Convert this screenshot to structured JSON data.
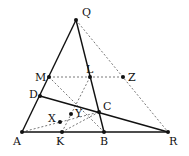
{
  "diagram": {
    "points": [
      {
        "name": "Q",
        "x": 76,
        "y": 20,
        "lx": 82,
        "ly": 16
      },
      {
        "name": "M",
        "x": 49,
        "y": 77,
        "lx": 35,
        "ly": 81
      },
      {
        "name": "L",
        "x": 90,
        "y": 77,
        "lx": 86,
        "ly": 73
      },
      {
        "name": "Z",
        "x": 123,
        "y": 77,
        "lx": 128,
        "ly": 81
      },
      {
        "name": "D",
        "x": 40,
        "y": 96,
        "lx": 29,
        "ly": 98
      },
      {
        "name": "C",
        "x": 99,
        "y": 112,
        "lx": 103,
        "ly": 110
      },
      {
        "name": "Y",
        "x": 71,
        "y": 114,
        "lx": 75,
        "ly": 117
      },
      {
        "name": "X",
        "x": 60,
        "y": 122,
        "lx": 48,
        "ly": 122
      },
      {
        "name": "A",
        "x": 22,
        "y": 132,
        "lx": 13,
        "ly": 145
      },
      {
        "name": "K",
        "x": 62,
        "y": 132,
        "lx": 56,
        "ly": 145
      },
      {
        "name": "B",
        "x": 104,
        "y": 132,
        "lx": 100,
        "ly": 145
      },
      {
        "name": "R",
        "x": 168,
        "y": 132,
        "lx": 169,
        "ly": 145
      }
    ],
    "solid_segments": [
      [
        "A",
        "Q"
      ],
      [
        "Q",
        "B"
      ],
      [
        "A",
        "R"
      ],
      [
        "D",
        "R"
      ]
    ],
    "dashed_segments": [
      [
        "Q",
        "R"
      ],
      [
        "M",
        "Z"
      ],
      [
        "M",
        "B"
      ],
      [
        "L",
        "K"
      ],
      [
        "A",
        "C"
      ],
      [
        "K",
        "C"
      ]
    ]
  }
}
